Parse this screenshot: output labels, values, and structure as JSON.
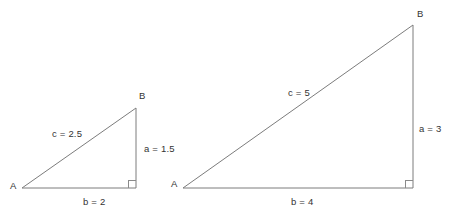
{
  "figure": {
    "background_color": "#ffffff",
    "stroke_color": "#7c7c7c",
    "text_color": "#333333",
    "width": 449,
    "height": 223
  },
  "triangles": [
    {
      "id": "small-triangle",
      "vertices": {
        "A": {
          "label": "A",
          "x": 22,
          "y": 188
        },
        "B": {
          "label": "B",
          "x": 136,
          "y": 108
        },
        "C": {
          "label": "",
          "x": 136,
          "y": 188
        }
      },
      "sides": {
        "hypotenuse": {
          "name": "c",
          "value": "2.5",
          "label": "c = 2.5"
        },
        "vertical_leg": {
          "name": "a",
          "value": "1.5",
          "label": "a = 1.5"
        },
        "base_leg": {
          "name": "b",
          "value": "2",
          "label": "b = 2"
        }
      },
      "right_angle_at": "C"
    },
    {
      "id": "large-triangle",
      "vertices": {
        "A": {
          "label": "A",
          "x": 183,
          "y": 188
        },
        "B": {
          "label": "B",
          "x": 413,
          "y": 25
        },
        "C": {
          "label": "",
          "x": 413,
          "y": 188
        }
      },
      "sides": {
        "hypotenuse": {
          "name": "c",
          "value": "5",
          "label": "c = 5"
        },
        "vertical_leg": {
          "name": "a",
          "value": "3",
          "label": "a = 3"
        },
        "base_leg": {
          "name": "b",
          "value": "4",
          "label": "b = 4"
        }
      },
      "right_angle_at": "C"
    }
  ],
  "labels": {
    "small": {
      "vertex_a": "A",
      "vertex_b": "B",
      "hypotenuse": "c = 2.5",
      "vertical": "a = 1.5",
      "base": "b = 2"
    },
    "large": {
      "vertex_a": "A",
      "vertex_b": "B",
      "hypotenuse": "c = 5",
      "vertical": "a = 3",
      "base": "b = 4"
    }
  }
}
